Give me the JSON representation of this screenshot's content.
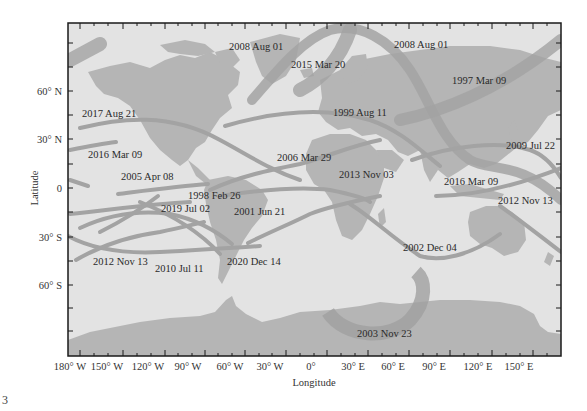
{
  "figure": {
    "type": "map",
    "xlabel": "Longitude",
    "ylabel": "Latitude",
    "x_ticks": [
      "180° W",
      "150° W",
      "120° W",
      "90° W",
      "60° W",
      "30° W",
      "0°",
      "30° E",
      "60° E",
      "90° E",
      "120° E",
      "150° E"
    ],
    "y_ticks": [
      "60° N",
      "30° N",
      "0",
      "30° S",
      "60° S"
    ],
    "corner_mark": "3"
  },
  "eclipses": [
    {
      "label": "2008 Aug 01"
    },
    {
      "label": "2008 Aug 01"
    },
    {
      "label": "2015 Mar 20"
    },
    {
      "label": "1997 Mar 09"
    },
    {
      "label": "2017 Aug 21"
    },
    {
      "label": "1999 Aug 11"
    },
    {
      "label": "2016 Mar 09"
    },
    {
      "label": "2006 Mar 29"
    },
    {
      "label": "2009 Jul 22"
    },
    {
      "label": "2005 Apr 08"
    },
    {
      "label": "2013 Nov 03"
    },
    {
      "label": "2016 Mar 09"
    },
    {
      "label": "1998 Feb 26"
    },
    {
      "label": "2012 Nov 13"
    },
    {
      "label": "2019 Jul 02"
    },
    {
      "label": "2001 Jun 21"
    },
    {
      "label": "2002 Dec 04"
    },
    {
      "label": "2012 Nov 13"
    },
    {
      "label": "2010 Jul 11"
    },
    {
      "label": "2020 Dec 14"
    },
    {
      "label": "2003 Nov 23"
    }
  ],
  "colors": {
    "ocean": "#e2e2e2",
    "land": "#b4b4b4",
    "path": "#a6a6a6",
    "frame": "#1a1a1a"
  }
}
